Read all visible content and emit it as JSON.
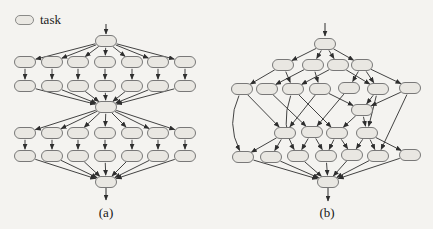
{
  "legend": {
    "label": "task",
    "swatch": "task-node"
  },
  "colors": {
    "background": "#f4f3f0",
    "node_fill": "#e9e7e2",
    "node_stroke": "#6b6b6b",
    "edge": "#2e2e2e",
    "text": "#161616"
  },
  "node": {
    "w": 21,
    "h": 11
  },
  "figures": [
    {
      "name": "fork-join-dag",
      "caption": "(a)",
      "nodes": {
        "root": [
          106,
          41
        ],
        "A1": [
          25,
          62
        ],
        "A2": [
          52,
          62
        ],
        "A3": [
          78,
          62
        ],
        "A4": [
          105,
          62
        ],
        "A5": [
          132,
          62
        ],
        "A6": [
          158,
          62
        ],
        "A7": [
          185,
          62
        ],
        "B1": [
          25,
          86
        ],
        "B2": [
          52,
          86
        ],
        "B3": [
          78,
          86
        ],
        "B4": [
          105,
          86
        ],
        "B5": [
          132,
          86
        ],
        "B6": [
          158,
          86
        ],
        "B7": [
          185,
          86
        ],
        "mid": [
          106,
          107
        ],
        "C1": [
          25,
          133
        ],
        "C2": [
          52,
          133
        ],
        "C3": [
          78,
          133
        ],
        "C4": [
          105,
          133
        ],
        "C5": [
          132,
          133
        ],
        "C6": [
          158,
          133
        ],
        "C7": [
          185,
          133
        ],
        "D1": [
          25,
          156
        ],
        "D2": [
          52,
          156
        ],
        "D3": [
          78,
          156
        ],
        "D4": [
          105,
          156
        ],
        "D5": [
          132,
          156
        ],
        "D6": [
          158,
          156
        ],
        "D7": [
          185,
          156
        ],
        "sink": [
          106,
          182
        ]
      },
      "edges": [
        {
          "from": "root",
          "to": "A1"
        },
        {
          "from": "root",
          "to": "A2"
        },
        {
          "from": "root",
          "to": "A3"
        },
        {
          "from": "root",
          "to": "A4"
        },
        {
          "from": "root",
          "to": "A5"
        },
        {
          "from": "root",
          "to": "A6"
        },
        {
          "from": "root",
          "to": "A7"
        },
        {
          "from": "A1",
          "to": "B1"
        },
        {
          "from": "A2",
          "to": "B2"
        },
        {
          "from": "A3",
          "to": "B3"
        },
        {
          "from": "A4",
          "to": "B4"
        },
        {
          "from": "A5",
          "to": "B5"
        },
        {
          "from": "A6",
          "to": "B6"
        },
        {
          "from": "A7",
          "to": "B7"
        },
        {
          "from": "B1",
          "to": "mid"
        },
        {
          "from": "B2",
          "to": "mid"
        },
        {
          "from": "B3",
          "to": "mid"
        },
        {
          "from": "B4",
          "to": "mid"
        },
        {
          "from": "B5",
          "to": "mid"
        },
        {
          "from": "B6",
          "to": "mid"
        },
        {
          "from": "B7",
          "to": "mid"
        },
        {
          "from": "mid",
          "to": "C1"
        },
        {
          "from": "mid",
          "to": "C2"
        },
        {
          "from": "mid",
          "to": "C3"
        },
        {
          "from": "mid",
          "to": "C4"
        },
        {
          "from": "mid",
          "to": "C5"
        },
        {
          "from": "mid",
          "to": "C6"
        },
        {
          "from": "mid",
          "to": "C7"
        },
        {
          "from": "C1",
          "to": "D1"
        },
        {
          "from": "C2",
          "to": "D2"
        },
        {
          "from": "C3",
          "to": "D3"
        },
        {
          "from": "C4",
          "to": "D4"
        },
        {
          "from": "C5",
          "to": "D5"
        },
        {
          "from": "C6",
          "to": "D6"
        },
        {
          "from": "C7",
          "to": "D7"
        },
        {
          "from": "D1",
          "to": "sink"
        },
        {
          "from": "D2",
          "to": "sink"
        },
        {
          "from": "D3",
          "to": "sink"
        },
        {
          "from": "D4",
          "to": "sink"
        },
        {
          "from": "D5",
          "to": "sink"
        },
        {
          "from": "D6",
          "to": "sink"
        },
        {
          "from": "D7",
          "to": "sink"
        }
      ],
      "io": [
        {
          "x1": 106,
          "y1": 24,
          "x2": 106,
          "y2": 34
        },
        {
          "x1": 106,
          "y1": 188,
          "x2": 106,
          "y2": 200
        }
      ]
    },
    {
      "name": "irregular-dag",
      "caption": "(b)",
      "nodes": {
        "root": [
          325,
          44
        ],
        "A": [
          283,
          65
        ],
        "B": [
          313,
          65
        ],
        "C": [
          338,
          65
        ],
        "D": [
          362,
          65
        ],
        "N1": [
          242,
          89
        ],
        "N2": [
          267,
          89
        ],
        "N3": [
          293,
          89
        ],
        "N4": [
          320,
          89
        ],
        "N5": [
          349,
          88
        ],
        "N6": [
          378,
          89
        ],
        "N7": [
          410,
          88
        ],
        "E": [
          362,
          110
        ],
        "F1": [
          285,
          133
        ],
        "F2": [
          312,
          132
        ],
        "F3": [
          337,
          133
        ],
        "F4": [
          367,
          133
        ],
        "G1": [
          243,
          157
        ],
        "G2": [
          271,
          157
        ],
        "G3": [
          298,
          156
        ],
        "G4": [
          326,
          156
        ],
        "G5": [
          352,
          155
        ],
        "G6": [
          378,
          156
        ],
        "G7": [
          410,
          155
        ],
        "sink": [
          328,
          182
        ]
      },
      "edges": [
        {
          "from": "root",
          "to": "A"
        },
        {
          "from": "root",
          "to": "B"
        },
        {
          "from": "root",
          "to": "C"
        },
        {
          "from": "root",
          "to": "D"
        },
        {
          "from": "A",
          "to": "N1"
        },
        {
          "from": "A",
          "to": "N3"
        },
        {
          "from": "B",
          "to": "N2"
        },
        {
          "from": "B",
          "to": "N4"
        },
        {
          "from": "C",
          "to": "N3"
        },
        {
          "from": "C",
          "to": "N6"
        },
        {
          "from": "D",
          "to": "N5"
        },
        {
          "from": "D",
          "to": "N6"
        },
        {
          "from": "D",
          "to": "N7"
        },
        {
          "from": "N4",
          "to": "E"
        },
        {
          "from": "N6",
          "to": "E"
        },
        {
          "from": "N7",
          "to": "E"
        },
        {
          "from": "N1",
          "to": "F1"
        },
        {
          "from": "N4",
          "to": "F1"
        },
        {
          "from": "N2",
          "to": "F2"
        },
        {
          "from": "N5",
          "to": "F2"
        },
        {
          "from": "N3",
          "to": "F3"
        },
        {
          "from": "E",
          "to": "F3"
        },
        {
          "from": "N6",
          "to": "F4"
        },
        {
          "from": "E",
          "to": "F4"
        },
        {
          "from": "N1",
          "to": "G1",
          "c": [
            226,
            124
          ]
        },
        {
          "from": "N3",
          "to": "G3",
          "c": [
            280,
            126
          ]
        },
        {
          "from": "N7",
          "to": "G6"
        },
        {
          "from": "F1",
          "to": "G1"
        },
        {
          "from": "F1",
          "to": "G2"
        },
        {
          "from": "F2",
          "to": "G3"
        },
        {
          "from": "F2",
          "to": "G4"
        },
        {
          "from": "F3",
          "to": "G4"
        },
        {
          "from": "F3",
          "to": "G5"
        },
        {
          "from": "F4",
          "to": "G5"
        },
        {
          "from": "F4",
          "to": "G6"
        },
        {
          "from": "F4",
          "to": "G7"
        },
        {
          "from": "G1",
          "to": "sink"
        },
        {
          "from": "G2",
          "to": "sink"
        },
        {
          "from": "G3",
          "to": "sink"
        },
        {
          "from": "G4",
          "to": "sink"
        },
        {
          "from": "G5",
          "to": "sink"
        },
        {
          "from": "G6",
          "to": "sink"
        },
        {
          "from": "G7",
          "to": "sink"
        }
      ],
      "io": [
        {
          "x1": 325,
          "y1": 23,
          "x2": 325,
          "y2": 36
        },
        {
          "x1": 328,
          "y1": 188,
          "x2": 328,
          "y2": 201
        }
      ]
    }
  ]
}
